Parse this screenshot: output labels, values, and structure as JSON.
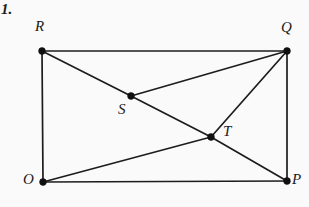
{
  "figure": {
    "item_number": "1.",
    "background_color": "#fbfafa",
    "line_color": "#1d1c1c",
    "label_color": "#1a1919",
    "width": 309,
    "height": 207,
    "points": {
      "R": {
        "label": "R",
        "x": 42,
        "y": 51
      },
      "Q": {
        "label": "Q",
        "x": 287,
        "y": 51
      },
      "O": {
        "label": "O",
        "x": 43,
        "y": 182
      },
      "P": {
        "label": "P",
        "x": 287,
        "y": 181
      },
      "S": {
        "label": "S",
        "x": 131,
        "y": 96
      },
      "T": {
        "label": "T",
        "x": 211,
        "y": 137
      }
    },
    "segments": [
      {
        "name": "R-Q",
        "from": "R",
        "to": "Q",
        "d": "M 42 51 L 287 51"
      },
      {
        "name": "Q-P",
        "from": "Q",
        "to": "P",
        "d": "M 287 51 L 287 181"
      },
      {
        "name": "P-O",
        "from": "P",
        "to": "O",
        "d": "M 287 181 L 43 182"
      },
      {
        "name": "O-R",
        "from": "O",
        "to": "R",
        "d": "M 43 182 L 42 51"
      },
      {
        "name": "R-S-T-P",
        "from": "R",
        "to": "P",
        "d": "M 42 51 L 131 96 L 211 137 L 287 181"
      },
      {
        "name": "O-T",
        "from": "O",
        "to": "T",
        "d": "M 43 182 L 211 137"
      },
      {
        "name": "T-Q",
        "from": "T",
        "to": "Q",
        "d": "M 211 137 L 287 51"
      },
      {
        "name": "S-Q",
        "from": "S",
        "to": "Q",
        "d": "M 131 96 L 287 51"
      }
    ],
    "vertex_radius": 3.4
  }
}
